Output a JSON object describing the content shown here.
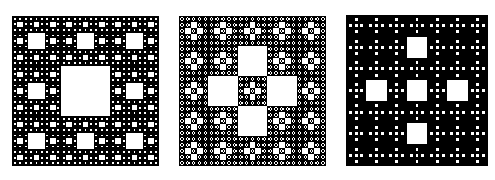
{
  "figure": {
    "background": "#ffffff",
    "fill_color": "#000000",
    "hole_color": "#ffffff",
    "panels": [
      {
        "name": "sierpinski-carpet",
        "grid_size": 3,
        "removed_cells": [
          [
            1,
            1
          ]
        ],
        "levels": 4,
        "box": {
          "x": 12,
          "y": 16,
          "w": 147,
          "h": 150
        }
      },
      {
        "name": "plus-cross-carpet-5x5",
        "grid_size": 5,
        "removed_cells": [
          [
            1,
            2
          ],
          [
            2,
            1
          ],
          [
            2,
            3
          ],
          [
            3,
            2
          ]
        ],
        "levels": 3,
        "box": {
          "x": 179,
          "y": 16,
          "w": 147,
          "h": 150
        }
      },
      {
        "name": "sparse-plus-carpet-7x7",
        "grid_size": 7,
        "removed_cells": [
          [
            1,
            3
          ],
          [
            3,
            1
          ],
          [
            3,
            3
          ],
          [
            3,
            5
          ],
          [
            5,
            3
          ]
        ],
        "levels": 2,
        "box": {
          "x": 346,
          "y": 15,
          "w": 142,
          "h": 151
        }
      }
    ]
  }
}
